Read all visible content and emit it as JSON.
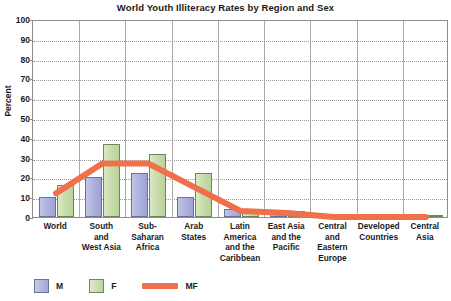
{
  "chart_data": {
    "type": "bar",
    "title": "World Youth Illiteracy Rates by Region and Sex",
    "xlabel": "",
    "ylabel": "Percent",
    "ylim": [
      0,
      100
    ],
    "yticks": [
      0,
      10,
      20,
      30,
      40,
      50,
      60,
      70,
      80,
      90,
      100
    ],
    "grid": true,
    "legend_position": "bottom-left",
    "categories": [
      "World",
      "South and West Asia",
      "Sub-Saharan Africa",
      "Arab States",
      "Latin America and the Caribbean",
      "East Asia and the Pacific",
      "Central and Eastern Europe",
      "Developed Countries",
      "Central Asia"
    ],
    "category_lines": [
      [
        "World"
      ],
      [
        "South",
        "and",
        "West Asia"
      ],
      [
        "Sub-",
        "Saharan",
        "Africa"
      ],
      [
        "Arab",
        "States"
      ],
      [
        "Latin",
        "America",
        "and the",
        "Caribbean"
      ],
      [
        "East Asia",
        "and the",
        "Pacific"
      ],
      [
        "Central",
        "and",
        "Eastern",
        "Europe"
      ],
      [
        "Developed",
        "Countries"
      ],
      [
        "Central",
        "Asia"
      ]
    ],
    "series": [
      {
        "name": "M",
        "type": "bar",
        "color": "#aeb2de",
        "values": [
          10,
          20,
          22,
          10,
          4,
          2,
          1,
          1,
          1
        ]
      },
      {
        "name": "F",
        "type": "bar",
        "color": "#c7ddab",
        "values": [
          16,
          37,
          32,
          22,
          3,
          3,
          1,
          1,
          1
        ]
      },
      {
        "name": "MF",
        "type": "line",
        "color": "#ef704a",
        "values": [
          13,
          28,
          28,
          16,
          4,
          3,
          1,
          1,
          1
        ]
      }
    ]
  },
  "legend": {
    "items": [
      {
        "label": "M",
        "kind": "swatch-m"
      },
      {
        "label": "F",
        "kind": "swatch-f"
      },
      {
        "label": "MF",
        "kind": "swatch-line"
      }
    ]
  },
  "colors": {
    "male_bar": "#aeb2de",
    "female_bar": "#c7ddab",
    "mf_line": "#ef704a",
    "axis": "#8d8d8d",
    "grid": "#9a9a9a",
    "text": "#1a1a1a"
  }
}
